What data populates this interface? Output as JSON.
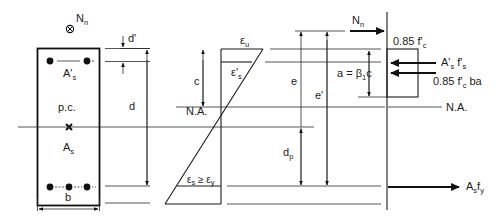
{
  "figure": {
    "type": "reinforced concrete section under eccentric axial load",
    "colors": {
      "ink": "#111111",
      "background": "#ffffff"
    }
  },
  "section": {
    "load_label": "N",
    "load_sub": "n",
    "compression_steel_label": "A'",
    "compression_steel_sub": "s",
    "plastic_centroid_label": "p.c.",
    "tension_steel_label": "A",
    "tension_steel_sub": "s",
    "width_label": "b"
  },
  "dimensions": {
    "d_prime": "d'",
    "d": "d",
    "c": "c",
    "e": "e",
    "e_prime": "e'",
    "dp": "d",
    "dp_sub": "p"
  },
  "strain": {
    "eps_u": "ε",
    "eps_u_sub": "u",
    "eps_s_prime": "ε'",
    "eps_s_prime_sub": "s",
    "na_label": "N.A.",
    "eps_s_text_a": "ε",
    "eps_s_sub": "s",
    "eps_s_text_b": " ≥ ε",
    "eps_y_sub": "y"
  },
  "forces": {
    "nn_label": "N",
    "nn_sub": "n",
    "stress_block_label": "0.85 f'",
    "stress_block_sub": "c",
    "a_eq": "a = β",
    "a_eq_sub": "1",
    "a_eq_tail": "c",
    "comp_steel_force": "A'",
    "comp_steel_force_sub": "s",
    "comp_steel_force_f": " f'",
    "comp_steel_force_f_sub": "s",
    "concrete_force": "0.85 f'",
    "concrete_force_sub": "c",
    "concrete_force_tail": " ba",
    "na_label": "N.A.",
    "tension_force": "A",
    "tension_force_sub": "s",
    "tension_force_f": "f",
    "tension_force_f_sub": "y"
  }
}
